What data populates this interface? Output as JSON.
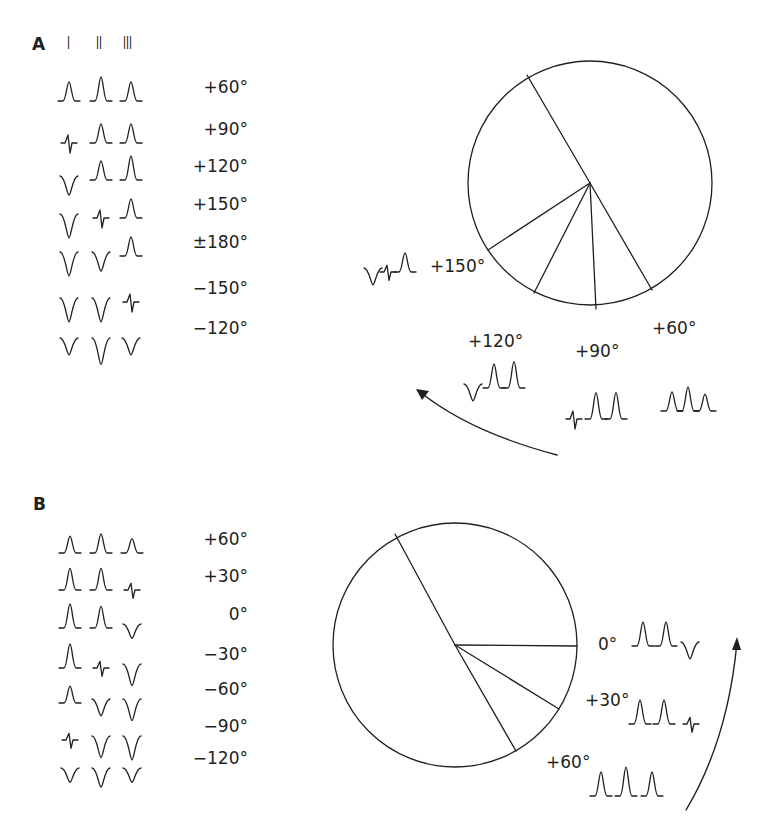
{
  "panels": {
    "A": {
      "letter": "A",
      "lead_headers": [
        "I",
        "II",
        "III"
      ],
      "columns_x": [
        69,
        101,
        131
      ],
      "rows": [
        {
          "axis": "+60°",
          "baseline": 101,
          "waves": [
            [
              "up",
              0.8
            ],
            [
              "up",
              1.0
            ],
            [
              "up",
              0.8
            ]
          ]
        },
        {
          "axis": "+90°",
          "baseline": 143,
          "waves": [
            [
              "bi",
              0.6
            ],
            [
              "up",
              0.8
            ],
            [
              "up",
              0.8
            ]
          ]
        },
        {
          "axis": "+120°",
          "baseline": 180,
          "waves": [
            [
              "down",
              0.8
            ],
            [
              "up",
              0.8
            ],
            [
              "up",
              1.0
            ]
          ]
        },
        {
          "axis": "+150°",
          "baseline": 218,
          "waves": [
            [
              "down",
              1.0
            ],
            [
              "bi",
              0.6
            ],
            [
              "up",
              0.8
            ]
          ]
        },
        {
          "axis": "±180°",
          "baseline": 256,
          "waves": [
            [
              "down",
              1.0
            ],
            [
              "down",
              0.8
            ],
            [
              "up",
              0.8
            ]
          ]
        },
        {
          "axis": "−150°",
          "baseline": 302,
          "waves": [
            [
              "down",
              1.0
            ],
            [
              "down",
              1.0
            ],
            [
              "bi",
              0.6
            ]
          ]
        },
        {
          "axis": "−120°",
          "baseline": 342,
          "waves": [
            [
              "down",
              0.7
            ],
            [
              "down",
              1.1
            ],
            [
              "down",
              0.7
            ]
          ]
        }
      ],
      "circle": {
        "cx": 590,
        "cy": 183,
        "r": 122
      },
      "spokes": [
        {
          "x2": 527,
          "y2": 75
        },
        {
          "x2": 488,
          "y2": 250
        },
        {
          "x2": 534,
          "y2": 293
        },
        {
          "x2": 596,
          "y2": 309
        },
        {
          "x2": 652,
          "y2": 290
        }
      ],
      "annotations": [
        {
          "label": "+150°",
          "x": 430,
          "y": 258,
          "waves_x": [
            373,
            388,
            405
          ],
          "waves_baseline": 272,
          "waves": [
            [
              "down",
              0.7
            ],
            [
              "bi",
              0.5
            ],
            [
              "up",
              0.8
            ]
          ]
        },
        {
          "label": "+120°",
          "x": 468,
          "y": 333,
          "waves_x": [
            473,
            494,
            514
          ],
          "waves_baseline": 388,
          "waves": [
            [
              "down",
              0.7
            ],
            [
              "up",
              1.0
            ],
            [
              "up",
              1.1
            ]
          ]
        },
        {
          "label": "+90°",
          "x": 575,
          "y": 343,
          "waves_x": [
            574,
            596,
            616
          ],
          "waves_baseline": 419,
          "waves": [
            [
              "bi",
              0.6
            ],
            [
              "up",
              1.1
            ],
            [
              "up",
              1.1
            ]
          ]
        },
        {
          "label": "+60°",
          "x": 652,
          "y": 320,
          "waves_x": [
            672,
            688,
            705
          ],
          "waves_baseline": 411,
          "waves": [
            [
              "up",
              0.8
            ],
            [
              "up",
              1.0
            ],
            [
              "up",
              0.7
            ]
          ]
        }
      ],
      "arrow": {
        "path": "M557,455 Q470,432 420,392",
        "tip": [
          416,
          389
        ],
        "dir": "up-left"
      }
    },
    "B": {
      "letter": "B",
      "columns_x": [
        70,
        101,
        132
      ],
      "rows": [
        {
          "axis": "+60°",
          "baseline": 553,
          "waves": [
            [
              "up",
              0.7
            ],
            [
              "up",
              0.8
            ],
            [
              "up",
              0.6
            ]
          ]
        },
        {
          "axis": "+30°",
          "baseline": 590,
          "waves": [
            [
              "up",
              0.9
            ],
            [
              "up",
              0.9
            ],
            [
              "bi",
              0.5
            ]
          ]
        },
        {
          "axis": "0°",
          "baseline": 628,
          "waves": [
            [
              "up",
              1.0
            ],
            [
              "up",
              0.9
            ],
            [
              "down",
              0.6
            ]
          ]
        },
        {
          "axis": "−30°",
          "baseline": 668,
          "waves": [
            [
              "up",
              1.0
            ],
            [
              "bi",
              0.5
            ],
            [
              "down",
              0.9
            ]
          ]
        },
        {
          "axis": "−60°",
          "baseline": 703,
          "waves": [
            [
              "up",
              0.7
            ],
            [
              "down",
              0.7
            ],
            [
              "down",
              0.9
            ]
          ]
        },
        {
          "axis": "−90°",
          "baseline": 740,
          "waves": [
            [
              "bi",
              0.5
            ],
            [
              "down",
              0.9
            ],
            [
              "down",
              1.0
            ]
          ]
        },
        {
          "axis": "−120°",
          "baseline": 772,
          "waves": [
            [
              "down",
              0.6
            ],
            [
              "down",
              0.8
            ],
            [
              "down",
              0.6
            ]
          ]
        }
      ],
      "circle": {
        "cx": 455,
        "cy": 645,
        "r": 122
      },
      "spokes": [
        {
          "x2": 395,
          "y2": 534
        },
        {
          "x2": 516,
          "y2": 751
        },
        {
          "x2": 577,
          "y2": 646
        },
        {
          "x2": 559,
          "y2": 709
        }
      ],
      "annotations": [
        {
          "label": "0°",
          "x": 598,
          "y": 636,
          "waves_x": [
            643,
            666,
            690
          ],
          "waves_baseline": 646,
          "waves": [
            [
              "up",
              1.0
            ],
            [
              "up",
              1.0
            ],
            [
              "down",
              0.7
            ]
          ]
        },
        {
          "label": "+30°",
          "x": 585,
          "y": 692,
          "waves_x": [
            640,
            664,
            691
          ],
          "waves_baseline": 724,
          "waves": [
            [
              "up",
              1.0
            ],
            [
              "up",
              1.0
            ],
            [
              "bi",
              0.5
            ]
          ]
        },
        {
          "label": "+60°",
          "x": 546,
          "y": 754,
          "waves_x": [
            601,
            626,
            652
          ],
          "waves_baseline": 796,
          "waves": [
            [
              "up",
              1.0
            ],
            [
              "up",
              1.2
            ],
            [
              "up",
              1.0
            ]
          ]
        }
      ],
      "arrow": {
        "path": "M686,810 Q728,740 737,642",
        "tip": [
          737,
          637
        ],
        "dir": "up"
      }
    }
  },
  "colors": {
    "stroke": "#231f20",
    "background": "#ffffff"
  }
}
